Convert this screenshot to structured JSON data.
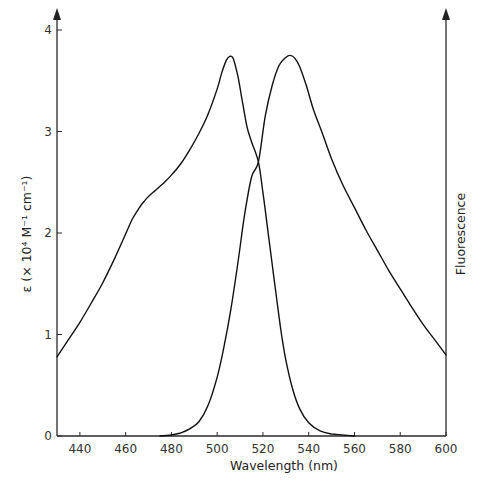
{
  "chart_data": {
    "type": "line",
    "title": "",
    "xlabel": "Wavelength (nm)",
    "ylabel": "ε (× 10⁴ M⁻¹ cm⁻¹)",
    "ylabel_right": "Fluorescence",
    "xlim": [
      430,
      600
    ],
    "ylim": [
      0,
      4
    ],
    "x_ticks": [
      440,
      460,
      480,
      500,
      520,
      540,
      560,
      580,
      600
    ],
    "y_ticks": [
      0,
      1,
      2,
      3,
      4
    ],
    "grid": false,
    "legend": null,
    "series": [
      {
        "name": "Absorption (ε)",
        "axis": "left",
        "x": [
          430,
          435,
          440,
          445,
          450,
          455,
          460,
          463,
          466,
          468,
          470,
          473,
          476,
          480,
          484,
          488,
          492,
          496,
          500,
          502,
          504,
          505.5,
          507,
          509,
          511,
          513,
          515,
          518,
          520,
          522,
          524,
          526,
          528,
          530,
          533,
          536,
          540,
          545,
          550,
          555,
          560
        ],
        "values": [
          0.78,
          0.95,
          1.12,
          1.31,
          1.51,
          1.74,
          1.99,
          2.14,
          2.25,
          2.31,
          2.36,
          2.42,
          2.48,
          2.57,
          2.68,
          2.82,
          2.98,
          3.17,
          3.42,
          3.58,
          3.7,
          3.74,
          3.72,
          3.55,
          3.3,
          3.05,
          2.9,
          2.7,
          2.4,
          2.05,
          1.7,
          1.35,
          1.02,
          0.75,
          0.46,
          0.27,
          0.13,
          0.05,
          0.02,
          0.01,
          0.0
        ]
      },
      {
        "name": "Fluorescence",
        "axis": "right",
        "x": [
          475,
          480,
          484,
          488,
          492,
          496,
          500,
          503,
          506,
          509,
          512,
          515,
          518,
          521,
          524,
          527,
          530,
          532,
          534,
          536,
          539,
          542,
          546,
          550,
          555,
          560,
          565,
          570,
          575,
          580,
          585,
          590,
          595,
          600
        ],
        "values": [
          0.0,
          0.01,
          0.03,
          0.07,
          0.14,
          0.3,
          0.58,
          0.88,
          1.25,
          1.7,
          2.18,
          2.55,
          2.7,
          3.15,
          3.45,
          3.65,
          3.73,
          3.75,
          3.72,
          3.64,
          3.45,
          3.22,
          2.98,
          2.73,
          2.47,
          2.25,
          2.03,
          1.83,
          1.63,
          1.45,
          1.27,
          1.1,
          0.95,
          0.8
        ]
      }
    ],
    "annotations": [
      "Absorption and fluorescence curves cross near 518 nm at ε ≈ 2.7"
    ]
  },
  "axes": {
    "x_title": "Wavelength (nm)",
    "y_left_title": "ε (× 10⁴ M⁻¹ cm⁻¹)",
    "y_right_title": "Fluorescence",
    "x_tick_labels": [
      "440",
      "460",
      "480",
      "500",
      "520",
      "540",
      "560",
      "580",
      "600"
    ],
    "y_tick_labels": [
      "0",
      "1",
      "2",
      "3",
      "4"
    ]
  }
}
